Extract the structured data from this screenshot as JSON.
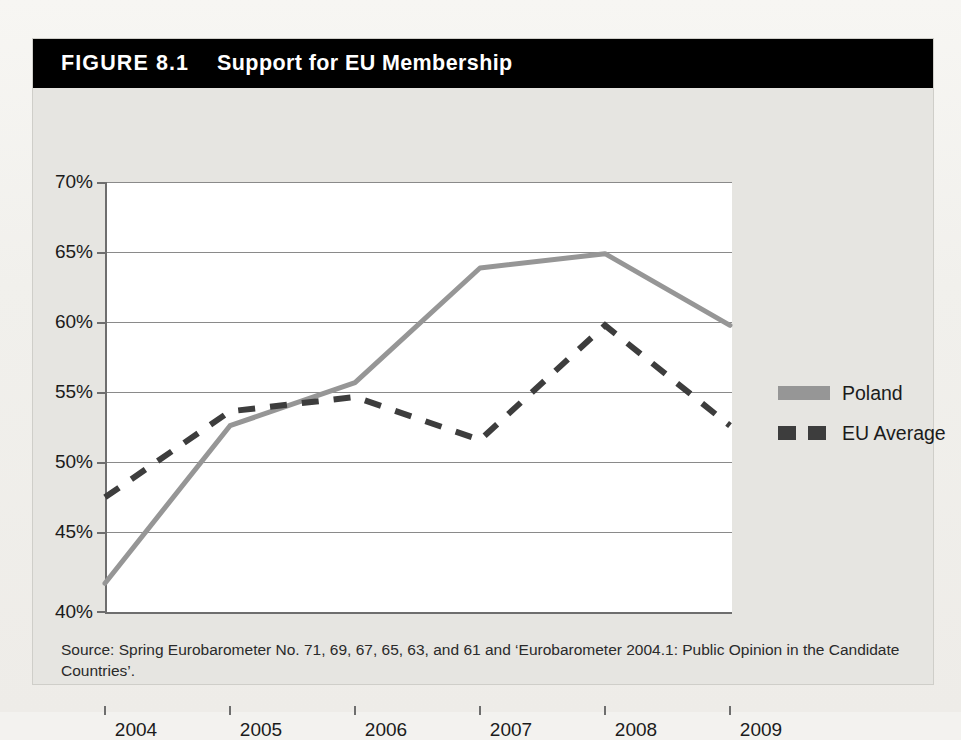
{
  "figure": {
    "number_label": "FIGURE 8.1",
    "title": "Support for EU Membership",
    "source_note": "Source: Spring Eurobarometer No. 71, 69, 67, 65, 63, and 61 and ‘Eurobarometer 2004.1: Public Opinion in the Candidate Countries’."
  },
  "colors": {
    "banner_background": "#000000",
    "banner_text": "#ffffff",
    "figure_background": "#e6e5e1",
    "plot_background": "#ffffff",
    "axis": "#6e6e6e",
    "gridline": "#8a8a8a",
    "poland_series": "#969696",
    "eu_average_series": "#3d3d3d"
  },
  "chart_data": {
    "type": "line",
    "title": "Support for EU Membership",
    "xlabel": "",
    "ylabel": "",
    "x": [
      "2004",
      "2005",
      "2006",
      "2007",
      "2008",
      "2009"
    ],
    "ylim": [
      40,
      70
    ],
    "yticks": [
      40,
      45,
      50,
      55,
      60,
      65,
      70
    ],
    "ytick_labels": [
      "40%",
      "45%",
      "50%",
      "55%",
      "60%",
      "65%",
      "70%"
    ],
    "grid": true,
    "legend_position": "right",
    "series": [
      {
        "name": "Poland",
        "style": "solid",
        "color": "#969696",
        "values": [
          42,
          53,
          56,
          64,
          65,
          60
        ]
      },
      {
        "name": "EU Average",
        "style": "dashed",
        "color": "#3d3d3d",
        "values": [
          48,
          54,
          55,
          52,
          60,
          53
        ]
      }
    ]
  }
}
